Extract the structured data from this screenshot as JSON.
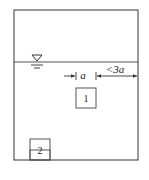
{
  "diagram": {
    "type": "tank-cross-section",
    "colors": {
      "line": "#555555",
      "text": "#222222",
      "background": "#ffffff"
    },
    "water_surface_symbol": "free-surface-triangle",
    "dimensions": {
      "a_label": "a",
      "gap_label": "<3a"
    },
    "blocks": [
      {
        "id": "block-1",
        "label": "1"
      },
      {
        "id": "block-2",
        "label": "2"
      }
    ]
  }
}
